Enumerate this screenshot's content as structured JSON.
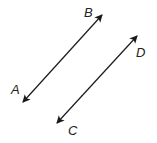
{
  "diagram": {
    "type": "parallel-lines",
    "lines": [
      {
        "name": "AB",
        "endpoints": [
          {
            "label": "A",
            "x": 23,
            "y": 102,
            "label_x": 11,
            "label_y": 94
          },
          {
            "label": "B",
            "x": 102,
            "y": 15,
            "label_x": 84,
            "label_y": 17
          }
        ]
      },
      {
        "name": "CD",
        "endpoints": [
          {
            "label": "C",
            "x": 57,
            "y": 123,
            "label_x": 68,
            "label_y": 135
          },
          {
            "label": "D",
            "x": 137,
            "y": 36,
            "label_x": 136,
            "label_y": 57
          }
        ]
      }
    ],
    "stroke_color": "#1a1a1a",
    "arrowheads": "both-ends"
  }
}
